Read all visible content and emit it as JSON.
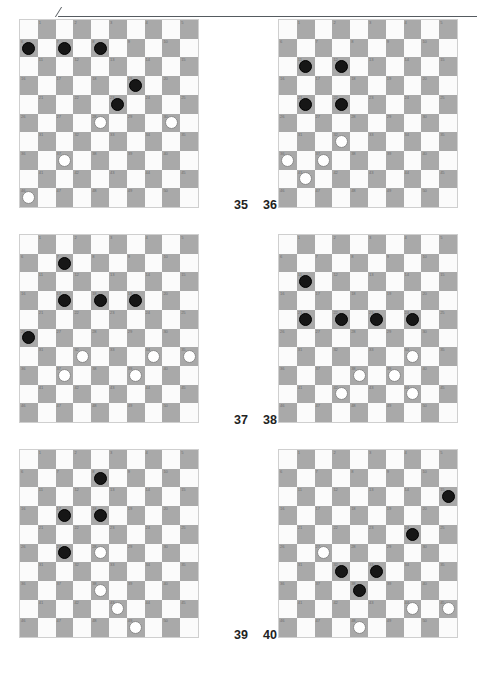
{
  "page": {
    "kind": "draughts-puzzle-sheet",
    "board_size": 10,
    "numbered_squares": 50,
    "colors": {
      "dark_square": "#a9a9a9",
      "light_square": "#fbfbfb",
      "black_piece": "#161616",
      "white_piece": "#ffffff",
      "rule": "#555b60",
      "square_number": "#6e6e6e"
    },
    "top_rule": {
      "present": true,
      "tick_icon": "diagonal-tick-icon"
    }
  },
  "square_numbers": [
    1,
    2,
    3,
    4,
    5,
    6,
    7,
    8,
    9,
    10,
    11,
    12,
    13,
    14,
    15,
    16,
    17,
    18,
    19,
    20,
    21,
    22,
    23,
    24,
    25,
    26,
    27,
    28,
    29,
    30,
    31,
    32,
    33,
    34,
    35,
    36,
    37,
    38,
    39,
    40,
    41,
    42,
    43,
    44,
    45,
    46,
    47,
    48,
    49,
    50
  ],
  "puzzles": [
    {
      "number": "35",
      "position": "top-left",
      "black": [
        6,
        7,
        8,
        19,
        23
      ],
      "white": [
        28,
        30,
        37,
        46
      ]
    },
    {
      "number": "36",
      "position": "top-right",
      "black": [
        11,
        12,
        21,
        22
      ],
      "white": [
        32,
        36,
        37,
        41
      ]
    },
    {
      "number": "37",
      "position": "middle-left",
      "black": [
        7,
        17,
        18,
        19,
        26
      ],
      "white": [
        32,
        34,
        35,
        37,
        39
      ]
    },
    {
      "number": "38",
      "position": "middle-right",
      "black": [
        11,
        21,
        22,
        23,
        24
      ],
      "white": [
        34,
        38,
        39,
        42,
        44
      ]
    },
    {
      "number": "39",
      "position": "bottom-left",
      "black": [
        8,
        17,
        18,
        27
      ],
      "white": [
        28,
        38,
        43,
        49
      ]
    },
    {
      "number": "40",
      "position": "bottom-right",
      "black": [
        15,
        24,
        32,
        33,
        38
      ],
      "white": [
        27,
        44,
        45,
        48
      ]
    }
  ]
}
